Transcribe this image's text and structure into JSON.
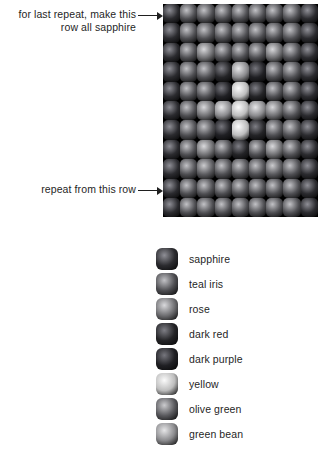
{
  "annotations": {
    "top_note": "for last repeat, make this row all sapphire",
    "bottom_note": "repeat from this row",
    "arrow_icon_top": "arrow-right-icon",
    "arrow_icon_bottom": "arrow-right-icon"
  },
  "palette": {
    "sapphire": {
      "name": "sapphire",
      "hex": "#2b2b2f",
      "highlight": "#8f8f96"
    },
    "teal_iris": {
      "name": "teal iris",
      "hex": "#4f4f53",
      "highlight": "#c2c2c6"
    },
    "rose": {
      "name": "rose",
      "hex": "#6f6f72",
      "highlight": "#d9d9dc"
    },
    "dark_red": {
      "name": "dark red",
      "hex": "#242427",
      "highlight": "#7e7e85"
    },
    "dark_purple": {
      "name": "dark purple",
      "hex": "#202024",
      "highlight": "#76767d"
    },
    "yellow": {
      "name": "yellow",
      "hex": "#bdbdbd",
      "highlight": "#fbfbfb"
    },
    "olive_green": {
      "name": "olive green",
      "hex": "#5a5a5e",
      "highlight": "#cbcbce"
    },
    "green_bean": {
      "name": "green bean",
      "hex": "#8b8b8e",
      "highlight": "#e6e6e8"
    }
  },
  "legend": {
    "items": [
      {
        "key": "sapphire",
        "label": "sapphire"
      },
      {
        "key": "teal_iris",
        "label": "teal iris"
      },
      {
        "key": "rose",
        "label": "rose"
      },
      {
        "key": "dark_red",
        "label": "dark red"
      },
      {
        "key": "dark_purple",
        "label": "dark purple"
      },
      {
        "key": "yellow",
        "label": "yellow"
      },
      {
        "key": "olive_green",
        "label": "olive green"
      },
      {
        "key": "green_bean",
        "label": "green bean"
      }
    ]
  },
  "chart_data": {
    "type": "heatmap",
    "title": "",
    "columns": 9,
    "rows": 11,
    "legend_position": "bottom",
    "categories": [
      "sapphire",
      "teal iris",
      "rose",
      "dark red",
      "dark purple",
      "yellow",
      "olive green",
      "green bean"
    ],
    "grid": [
      [
        "sapphire",
        "teal_iris",
        "teal_iris",
        "teal_iris",
        "teal_iris",
        "teal_iris",
        "teal_iris",
        "teal_iris",
        "sapphire"
      ],
      [
        "sapphire",
        "teal_iris",
        "teal_iris",
        "teal_iris",
        "teal_iris",
        "teal_iris",
        "teal_iris",
        "teal_iris",
        "sapphire"
      ],
      [
        "sapphire",
        "teal_iris",
        "rose",
        "teal_iris",
        "teal_iris",
        "teal_iris",
        "rose",
        "teal_iris",
        "sapphire"
      ],
      [
        "sapphire",
        "teal_iris",
        "teal_iris",
        "dark_red",
        "green_bean",
        "dark_purple",
        "teal_iris",
        "teal_iris",
        "sapphire"
      ],
      [
        "sapphire",
        "teal_iris",
        "teal_iris",
        "dark_purple",
        "yellow",
        "dark_red",
        "teal_iris",
        "teal_iris",
        "sapphire"
      ],
      [
        "sapphire",
        "teal_iris",
        "rose",
        "green_bean",
        "yellow",
        "green_bean",
        "rose",
        "teal_iris",
        "sapphire"
      ],
      [
        "sapphire",
        "teal_iris",
        "teal_iris",
        "dark_purple",
        "yellow",
        "dark_red",
        "teal_iris",
        "teal_iris",
        "sapphire"
      ],
      [
        "sapphire",
        "teal_iris",
        "rose",
        "teal_iris",
        "dark_red",
        "teal_iris",
        "rose",
        "teal_iris",
        "sapphire"
      ],
      [
        "sapphire",
        "teal_iris",
        "olive_green",
        "teal_iris",
        "teal_iris",
        "teal_iris",
        "olive_green",
        "teal_iris",
        "sapphire"
      ],
      [
        "sapphire",
        "teal_iris",
        "teal_iris",
        "teal_iris",
        "teal_iris",
        "teal_iris",
        "teal_iris",
        "teal_iris",
        "sapphire"
      ],
      [
        "sapphire",
        "teal_iris",
        "teal_iris",
        "teal_iris",
        "teal_iris",
        "teal_iris",
        "teal_iris",
        "teal_iris",
        "sapphire"
      ]
    ],
    "annotations": [
      {
        "text": "for last repeat, make this row all sapphire",
        "target_row": 1
      },
      {
        "text": "repeat from this row",
        "target_row": 10
      }
    ]
  }
}
